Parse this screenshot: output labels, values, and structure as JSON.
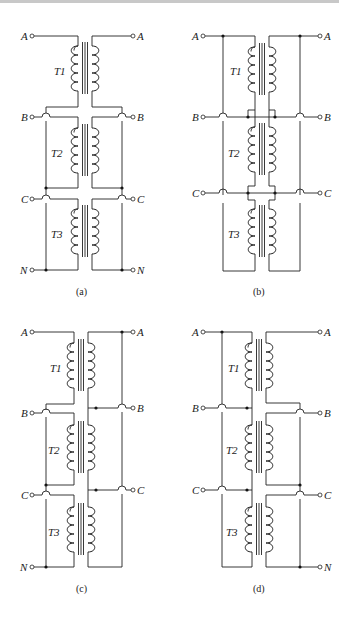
{
  "figure": {
    "panels": [
      {
        "id": "a",
        "caption": "(a)",
        "terminals_left": [
          "A",
          "B",
          "C",
          "N"
        ],
        "terminals_right": [
          "A",
          "B",
          "C",
          "N"
        ],
        "transformers": [
          "T1",
          "T2",
          "T3"
        ]
      },
      {
        "id": "b",
        "caption": "(b)",
        "terminals_left": [
          "A",
          "B",
          "C"
        ],
        "terminals_right": [
          "A",
          "B",
          "C"
        ],
        "transformers": [
          "T1",
          "T2",
          "T3"
        ]
      },
      {
        "id": "c",
        "caption": "(c)",
        "terminals_left": [
          "A",
          "B",
          "C",
          "N"
        ],
        "terminals_right": [
          "A",
          "B",
          "C"
        ],
        "transformers": [
          "T1",
          "T2",
          "T3"
        ]
      },
      {
        "id": "d",
        "caption": "(d)",
        "terminals_left": [
          "A",
          "B",
          "C"
        ],
        "terminals_right": [
          "A",
          "B",
          "C",
          "N"
        ],
        "transformers": [
          "T1",
          "T2",
          "T3"
        ]
      }
    ]
  },
  "colors": {
    "line": "#222222",
    "background": "#ffffff"
  }
}
